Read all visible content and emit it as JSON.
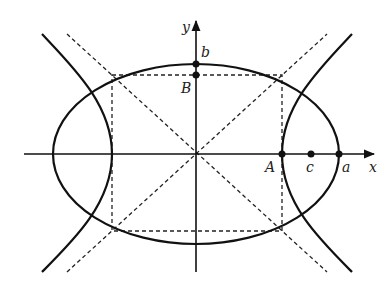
{
  "diagram": {
    "type": "conic-sections",
    "labels": {
      "x_axis": "x",
      "y_axis": "y",
      "point_A": "A",
      "point_B": "B",
      "point_a": "a",
      "point_b": "b",
      "point_c": "c"
    },
    "colors": {
      "stroke": "#111111",
      "background": "#ffffff"
    }
  }
}
